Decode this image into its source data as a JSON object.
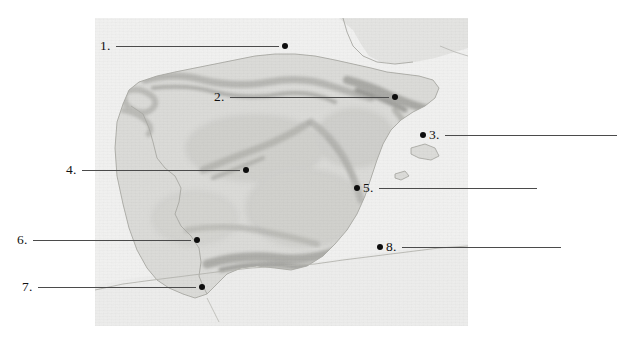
{
  "page": {
    "background_color": "#ffffff",
    "width": 617,
    "height": 341
  },
  "map": {
    "name": "iberian-peninsula-relief-map",
    "region": "Iberian Peninsula",
    "style": "shaded relief, grayscale",
    "land_color": "#d9d9d6",
    "sea_color": "#f2f2f1",
    "border_line_color": "#b8b8b4",
    "frame": {
      "x": 95,
      "y": 18,
      "width": 373,
      "height": 308
    }
  },
  "callouts": [
    {
      "id": 1,
      "label": "1.",
      "layout": "label-line-dot",
      "label_x": 100,
      "label_y": 38,
      "line_start_x": 120,
      "line_end_x": 282,
      "dot_x": 287,
      "dot_y": 45,
      "answer": ""
    },
    {
      "id": 2,
      "label": "2.",
      "layout": "label-line-dot",
      "label_x": 214,
      "label_y": 89,
      "line_start_x": 233,
      "line_end_x": 391,
      "dot_x": 396,
      "dot_y": 96,
      "answer": ""
    },
    {
      "id": 3,
      "label": "3.",
      "layout": "dot-label-line",
      "dot_x": 423,
      "dot_y": 134,
      "label_x": 430,
      "label_y": 127,
      "line_start_x": 447,
      "line_end_x": 617,
      "answer": ""
    },
    {
      "id": 4,
      "label": "4.",
      "layout": "label-line-dot",
      "label_x": 66,
      "label_y": 162,
      "line_start_x": 85,
      "line_end_x": 242,
      "dot_x": 247,
      "dot_y": 169,
      "answer": ""
    },
    {
      "id": 5,
      "label": "5.",
      "layout": "dot-label-line",
      "dot_x": 357,
      "dot_y": 187,
      "label_x": 364,
      "label_y": 180,
      "line_start_x": 382,
      "line_end_x": 540,
      "answer": ""
    },
    {
      "id": 6,
      "label": "6.",
      "layout": "label-line-dot",
      "dot_x": 198,
      "dot_y": 239,
      "label_x": 17,
      "label_y": 232,
      "line_start_x": 36,
      "line_end_x": 193,
      "answer": ""
    },
    {
      "id": 7,
      "label": "7.",
      "layout": "label-line-dot",
      "dot_x": 203,
      "dot_y": 286,
      "label_x": 22,
      "label_y": 279,
      "line_start_x": 41,
      "line_end_x": 198,
      "answer": ""
    },
    {
      "id": 8,
      "label": "8.",
      "layout": "dot-label-line",
      "dot_x": 380,
      "dot_y": 246,
      "label_x": 388,
      "label_y": 239,
      "line_start_x": 406,
      "line_end_x": 565,
      "answer": ""
    }
  ],
  "colors": {
    "dot": "#0d0d0d",
    "leader_line": "#4b4b4b",
    "text": "#111111"
  }
}
